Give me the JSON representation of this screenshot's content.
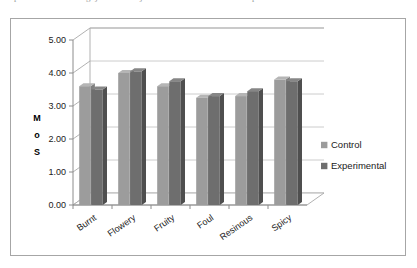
{
  "top_fragments": [
    {
      "text": "p",
      "x": 14
    },
    {
      "text": "g j",
      "x": 86
    },
    {
      "text": "j",
      "x": 140
    },
    {
      "text": "p",
      "x": 252
    }
  ],
  "chart_data": {
    "type": "bar",
    "title": "",
    "subtitle": "",
    "xlabel": "",
    "ylabel": "MOS",
    "ylabel_stacked": [
      "M",
      "o",
      "S"
    ],
    "categories": [
      "Burnt",
      "Flowery",
      "Fruity",
      "Foul",
      "Resinous",
      "Spicy"
    ],
    "series": [
      {
        "name": "Control",
        "values": [
          3.6,
          4.0,
          3.6,
          3.25,
          3.3,
          3.8
        ],
        "color": "#9c9c9c"
      },
      {
        "name": "Experimental",
        "values": [
          3.5,
          4.05,
          3.75,
          3.3,
          3.45,
          3.75
        ],
        "color": "#6e6e6e"
      }
    ],
    "ylim": [
      0,
      5
    ],
    "ytick_values": [
      0,
      1,
      2,
      3,
      4,
      5
    ],
    "ytick_labels": [
      "0.00",
      "1.00",
      "2.00",
      "3.00",
      "4.00",
      "5.00"
    ],
    "grid": true,
    "grid_axis": "y",
    "legend": [
      "Control",
      "Experimental"
    ],
    "legend_position": "right",
    "three_d": true,
    "bar_style": "3d-column"
  },
  "colors": {
    "control_face": "#9c9c9c",
    "control_side": "#7f7f7f",
    "control_top": "#b5b5b5",
    "experimental_face": "#6e6e6e",
    "experimental_side": "#4f4f4f",
    "experimental_top": "#868686",
    "gridline": "#bfbfbf",
    "axis": "#8c8c8c",
    "frame": "#a6a6a6",
    "text": "#1a1a1a",
    "background": "#ffffff"
  }
}
